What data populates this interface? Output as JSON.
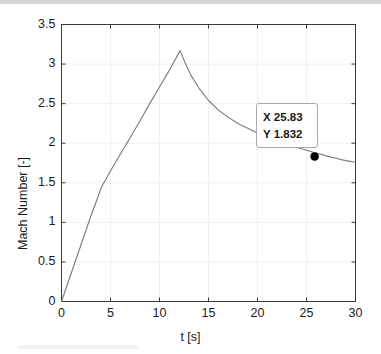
{
  "chart_data": {
    "type": "line",
    "title": "",
    "xlabel": "t [s]",
    "ylabel": "Mach Number [-]",
    "xlim": [
      0,
      30
    ],
    "ylim": [
      0,
      3.5
    ],
    "xticks": [
      "0",
      "5",
      "10",
      "15",
      "20",
      "25",
      "30"
    ],
    "xtick_values": [
      0,
      5,
      10,
      15,
      20,
      25,
      30
    ],
    "yticks": [
      "0",
      "0.5",
      "1",
      "1.5",
      "2",
      "2.5",
      "3",
      "3.5"
    ],
    "ytick_values": [
      0,
      0.5,
      1,
      1.5,
      2,
      2.5,
      3,
      3.5
    ],
    "grid": true,
    "legend": null,
    "series": [
      {
        "name": "Mach Number",
        "color": "#7a7a7a",
        "x": [
          0,
          1,
          2,
          3,
          4.1,
          5,
          6,
          7,
          8,
          9,
          10,
          11,
          12.1,
          12.6,
          13.2,
          14,
          15,
          16,
          17,
          18,
          19,
          20,
          21,
          22,
          23,
          24,
          25,
          25.83,
          26.5,
          27,
          28,
          29,
          30
        ],
        "y": [
          0,
          0.36,
          0.72,
          1.08,
          1.45,
          1.65,
          1.86,
          2.07,
          2.28,
          2.5,
          2.71,
          2.92,
          3.17,
          3.02,
          2.86,
          2.7,
          2.54,
          2.42,
          2.33,
          2.25,
          2.19,
          2.13,
          2.08,
          2.03,
          1.99,
          1.95,
          1.91,
          1.88,
          1.86,
          1.84,
          1.81,
          1.78,
          1.76
        ]
      }
    ],
    "annotations": [
      {
        "type": "datatip",
        "x_label": "X 25.83",
        "y_label": "Y 1.832",
        "x_value": 25.83,
        "y_value": 1.832,
        "marker": "filled-circle",
        "marker_color": "#000000"
      }
    ]
  },
  "axes": {
    "x_label": "t [s]",
    "y_label": "Mach Number [-]"
  },
  "datatip": {
    "x_text": "X 25.83",
    "y_text": "Y 1.832"
  },
  "colors": {
    "line": "#7a7a7a",
    "axis": "#3a3a3a",
    "grid": "#f0f0f0",
    "text": "#1a1a1a",
    "marker": "#000000",
    "background": "#ffffff"
  }
}
